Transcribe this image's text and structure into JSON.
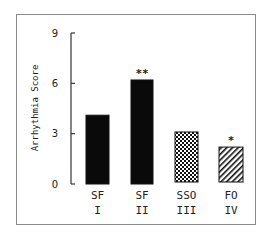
{
  "chart_data": {
    "type": "bar",
    "title": "",
    "xlabel": "",
    "ylabel": "Arrhythmia Score",
    "ylim": [
      0,
      9
    ],
    "yticks": [
      0,
      3,
      6,
      9
    ],
    "grid": false,
    "legend": null,
    "categories": [
      "SF I",
      "SF II",
      "SSO III",
      "FO IV"
    ],
    "category_lines": [
      {
        "top": "SF",
        "bottom": "I"
      },
      {
        "top": "SF",
        "bottom": "II"
      },
      {
        "top": "SSO",
        "bottom": "III"
      },
      {
        "top": "FO",
        "bottom": "IV"
      }
    ],
    "values": [
      4.1,
      6.2,
      3.1,
      2.2
    ],
    "fills": [
      "solid-black",
      "solid-black",
      "checkered",
      "diagonal-hatch"
    ],
    "annotations": [
      "",
      "**",
      "",
      "*"
    ]
  },
  "axis": {
    "tick_labels": [
      "0",
      "3",
      "6",
      "9"
    ]
  }
}
